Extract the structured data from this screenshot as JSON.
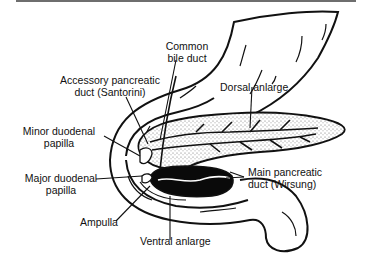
{
  "figure": {
    "labels": {
      "common_bile_duct": [
        "Common",
        "bile duct"
      ],
      "accessory_duct": [
        "Accessory pancreatic",
        "duct (Santorini)"
      ],
      "dorsal_anlarge": [
        "Dorsal anlarge"
      ],
      "minor_papilla": [
        "Minor duodenal",
        "papilla"
      ],
      "major_papilla": [
        "Major duodenal",
        "papilla"
      ],
      "main_duct": [
        "Main pancreatic",
        "duct (Wirsung)"
      ],
      "ampulla": [
        "Ampulla"
      ],
      "ventral_anlarge": [
        "Ventral anlarge"
      ]
    },
    "colors": {
      "ink": "#111111",
      "ventral_fill": "#0a0a0a",
      "dorsal_stipple": "#777777",
      "background": "#ffffff",
      "top_rule": "#6e6e6e"
    }
  }
}
